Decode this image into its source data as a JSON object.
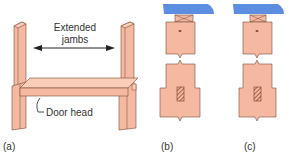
{
  "figure": {
    "panels": [
      {
        "id": "a",
        "caption": "(a)",
        "description": "Door frame with extended jambs and door head"
      },
      {
        "id": "b",
        "caption": "(b)",
        "description": "Jamb section with horn under sill/lintel, wide base"
      },
      {
        "id": "c",
        "caption": "(c)",
        "description": "Jamb section with horn under sill/lintel, narrower"
      }
    ],
    "labels": {
      "extended_jambs": "Extended\njambs",
      "extended_line1": "Extended",
      "extended_line2": "jambs",
      "door_head": "Door head"
    },
    "colors": {
      "timber": "#f4b9a0",
      "timber_dark": "#e39e85",
      "outline": "#7a4a3a",
      "blue_cap": "#5b8de0",
      "hatch": "#7a3b2a"
    }
  }
}
